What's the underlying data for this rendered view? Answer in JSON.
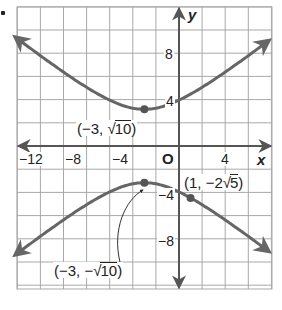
{
  "chart_data": {
    "type": "line",
    "title": "",
    "equation": "y^2/10 - (x+3)^2/16 = 1",
    "xlabel": "x",
    "ylabel": "y",
    "origin_label": "O",
    "xlim": [
      -14,
      8
    ],
    "ylim": [
      -12,
      12
    ],
    "grid": true,
    "grid_step": 2,
    "x_tick_labels": [
      "-12",
      "-8",
      "-4",
      "4"
    ],
    "x_ticks": [
      -12,
      -8,
      -4,
      4
    ],
    "y_tick_labels": [
      "8",
      "4",
      "-4",
      "-8"
    ],
    "y_ticks": [
      8,
      4,
      -4,
      -8
    ],
    "series": [
      {
        "name": "upper branch",
        "points": [
          [
            -14,
            8.78
          ],
          [
            -10,
            5.76
          ],
          [
            -6,
            3.72
          ],
          [
            -3,
            3.16
          ],
          [
            0,
            3.72
          ],
          [
            4,
            5.76
          ],
          [
            8,
            8.78
          ]
        ]
      },
      {
        "name": "lower branch",
        "points": [
          [
            -14,
            -8.78
          ],
          [
            -10,
            -5.76
          ],
          [
            -6,
            -3.72
          ],
          [
            -3,
            -3.16
          ],
          [
            0,
            -3.72
          ],
          [
            1,
            -4.47
          ],
          [
            4,
            -5.76
          ],
          [
            8,
            -8.78
          ]
        ]
      }
    ],
    "points": [
      {
        "x": -3,
        "y": 3.162,
        "label": "(−3, √10)"
      },
      {
        "x": -3,
        "y": -3.162,
        "label": "(−3, −√10)"
      },
      {
        "x": 1,
        "y": -4.472,
        "label": "(1, −2√5)"
      }
    ],
    "colors": {
      "curve": "#666666",
      "grid": "#9a9a9a",
      "axis": "#555555",
      "text": "#222222"
    }
  },
  "labels": {
    "x_axis": "x",
    "y_axis": "y",
    "origin": "O",
    "xt_m12": "−12",
    "xt_m8": "−8",
    "xt_m4": "−4",
    "xt_4": "4",
    "yt_8": "8",
    "yt_4": "4",
    "yt_m4": "−4",
    "yt_m8": "−8",
    "vertex_top_pre": "(−3, ",
    "vertex_top_rad": "10",
    "vertex_top_post": ")",
    "vertex_bot_pre": "(−3, −",
    "vertex_bot_rad": "10",
    "vertex_bot_post": ")",
    "point_pre": "(1, −2",
    "point_rad": "5",
    "point_post": ")",
    "sqrt": "√"
  }
}
